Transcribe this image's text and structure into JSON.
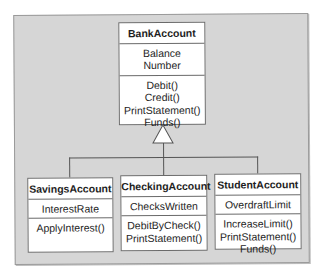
{
  "diagram": {
    "type": "uml-class-diagram",
    "parent": {
      "name": "BankAccount",
      "attributes": [
        "Balance",
        "Number"
      ],
      "operations": [
        "Debit()",
        "Credit()",
        "PrintStatement()",
        "Funds()"
      ]
    },
    "children": [
      {
        "name": "SavingsAccount",
        "attributes": [
          "InterestRate"
        ],
        "operations": [
          "ApplyInterest()"
        ]
      },
      {
        "name": "CheckingAccount",
        "attributes": [
          "ChecksWritten"
        ],
        "operations": [
          "DebitByCheck()",
          "PrintStatement()"
        ]
      },
      {
        "name": "StudentAccount",
        "attributes": [
          "OverdraftLimit"
        ],
        "operations": [
          "IncreaseLimit()",
          "PrintStatement()",
          "Funds()"
        ]
      }
    ],
    "relationship": "inheritance"
  }
}
